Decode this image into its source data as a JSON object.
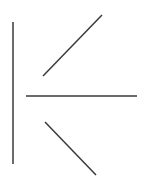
{
  "figure": {
    "width": 151,
    "height": 180,
    "background": "#ffffff",
    "stroke_color": "#3a3a3a",
    "stroke_width": 1.5,
    "lines": [
      {
        "name": "vertical-line",
        "x1": 13,
        "y1": 22,
        "x2": 13,
        "y2": 164
      },
      {
        "name": "upper-diagonal-line",
        "x1": 43,
        "y1": 76,
        "x2": 102,
        "y2": 15
      },
      {
        "name": "horizontal-line",
        "x1": 26,
        "y1": 96,
        "x2": 137,
        "y2": 96
      },
      {
        "name": "lower-diagonal-line",
        "x1": 45,
        "y1": 122,
        "x2": 96,
        "y2": 175
      }
    ]
  }
}
